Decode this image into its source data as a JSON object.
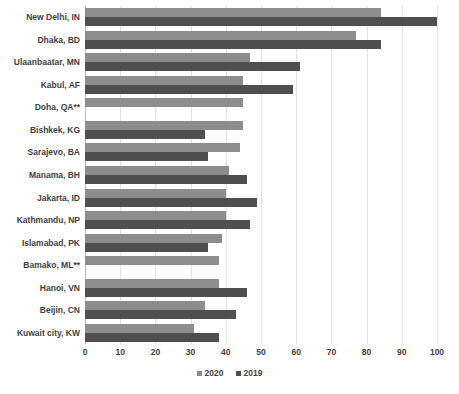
{
  "chart_data": {
    "type": "bar",
    "orientation": "horizontal",
    "title": "",
    "xlabel": "",
    "ylabel": "",
    "xlim": [
      0,
      100
    ],
    "xticks": [
      0,
      10,
      20,
      30,
      40,
      50,
      60,
      70,
      80,
      90,
      100
    ],
    "grid": true,
    "legend_position": "bottom",
    "categories": [
      "New Delhi, IN",
      "Dhaka, BD",
      "Ulaanbaatar, MN",
      "Kabul, AF",
      "Doha, QA**",
      "Bishkek, KG",
      "Sarajevo, BA",
      "Manama, BH",
      "Jakarta, ID",
      "Kathmandu, NP",
      "Islamabad, PK",
      "Bamako, ML**",
      "Hanoi, VN",
      "Beijin, CN",
      "Kuwait city, KW"
    ],
    "series": [
      {
        "name": "2020",
        "color": "#8d8d8d",
        "values": [
          84,
          77,
          47,
          45,
          45,
          45,
          44,
          41,
          40,
          40,
          39,
          38,
          38,
          34,
          31
        ]
      },
      {
        "name": "2019",
        "color": "#4f4f4f",
        "values": [
          100,
          84,
          61,
          59,
          null,
          34,
          35,
          46,
          49,
          47,
          35,
          null,
          46,
          43,
          38
        ]
      }
    ]
  },
  "legend": {
    "items": [
      {
        "label": "2020",
        "swatch_class": "s2020"
      },
      {
        "label": "2019",
        "swatch_class": "s2019"
      }
    ]
  }
}
